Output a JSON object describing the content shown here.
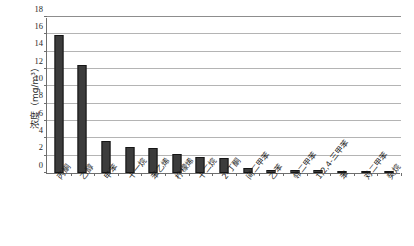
{
  "page": {
    "header_ghost_left": "",
    "header_ghost_mid": "",
    "header_ghost_right": ""
  },
  "chart_data": {
    "type": "bar",
    "title": "",
    "xlabel": "",
    "ylabel": "浓度（mg/m³）",
    "ylim": [
      0,
      18
    ],
    "yticks": [
      0,
      2,
      4,
      6,
      8,
      10,
      12,
      14,
      16,
      18
    ],
    "ytick_labels": [
      "0",
      "2",
      "4",
      "6",
      "8",
      "10",
      "12",
      "14",
      "16",
      "18"
    ],
    "grid": true,
    "legend": "none",
    "bar_color": "#3c3c3c",
    "bar_edge_color": "#151515",
    "categories": [
      "丙酮",
      "乙醇",
      "甲苯",
      "十一烷",
      "苯乙烯",
      "柠檬烯",
      "十二烷",
      "2-丁酮",
      "间二甲苯",
      "乙苯",
      "邻二甲苯",
      "1,2,4-三甲苯",
      "苯",
      "对二甲苯",
      "癸烷"
    ],
    "values": [
      15.9,
      12.5,
      3.75,
      3.0,
      2.85,
      2.2,
      1.8,
      1.7,
      0.6,
      0.4,
      0.38,
      0.35,
      0.25,
      0.25,
      0.2
    ]
  }
}
